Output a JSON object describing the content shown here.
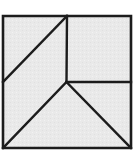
{
  "figure": {
    "kind": "geometric-line-diagram",
    "background_color": "#ffffff",
    "fill_color": "#e9e9e9",
    "line_color": "#1c1c1c",
    "outer_line_width": 2.6,
    "inner_line_width": 2.4,
    "canvas": {
      "width": 139,
      "height": 156
    },
    "outer_square": {
      "name": "outer-square",
      "left": 3,
      "top": 16,
      "right": 131,
      "bottom": 148,
      "width": 128,
      "height": 132,
      "points": "3,16 131,16 131,148 3,148"
    },
    "junction_point": {
      "x": 66.5,
      "y": 82
    },
    "pieces": [
      {
        "name": "top-left-triangle",
        "label": "Top-left triangle",
        "points": "3,16 67,16 3,82",
        "vertices": [
          [
            3,
            16
          ],
          [
            67,
            16
          ],
          [
            3,
            82
          ]
        ]
      },
      {
        "name": "left-middle-triangle",
        "label": "Left middle triangle",
        "points": "3,82 67,16 66.5,82 3,148",
        "vertices": [
          [
            3,
            82
          ],
          [
            67,
            16
          ],
          [
            66.5,
            82
          ],
          [
            3,
            148
          ]
        ]
      },
      {
        "name": "top-right-square",
        "label": "Top-right square",
        "points": "67,16 131,16 131,82 66.5,82",
        "vertices": [
          [
            67,
            16
          ],
          [
            131,
            16
          ],
          [
            131,
            82
          ],
          [
            66.5,
            82
          ]
        ]
      },
      {
        "name": "right-middle-triangle",
        "label": "Right middle triangle",
        "points": "66.5,82 131,82 131,148",
        "vertices": [
          [
            66.5,
            82
          ],
          [
            131,
            82
          ],
          [
            131,
            148
          ]
        ]
      },
      {
        "name": "bottom-triangle",
        "label": "Bottom triangle",
        "points": "66.5,82 131,148 3,148",
        "vertices": [
          [
            66.5,
            82
          ],
          [
            131,
            148
          ],
          [
            3,
            148
          ]
        ]
      }
    ],
    "inner_lines": [
      {
        "name": "diagonal-top-left",
        "label": "Diagonal from top edge to left edge",
        "x1": 67,
        "y1": 16,
        "x2": 3,
        "y2": 82
      },
      {
        "name": "vertical-divider",
        "label": "Vertical divider",
        "x1": 67,
        "y1": 16,
        "x2": 66.5,
        "y2": 82
      },
      {
        "name": "horizontal-divider",
        "label": "Horizontal divider",
        "x1": 66.5,
        "y1": 82,
        "x2": 131,
        "y2": 82
      },
      {
        "name": "diagonal-bottom-left",
        "label": "Diagonal from center to bottom-left corner",
        "x1": 66.5,
        "y1": 82,
        "x2": 3,
        "y2": 148
      },
      {
        "name": "diagonal-bottom-right",
        "label": "Diagonal from center to bottom-right corner",
        "x1": 66.5,
        "y1": 82,
        "x2": 131,
        "y2": 148
      }
    ]
  }
}
